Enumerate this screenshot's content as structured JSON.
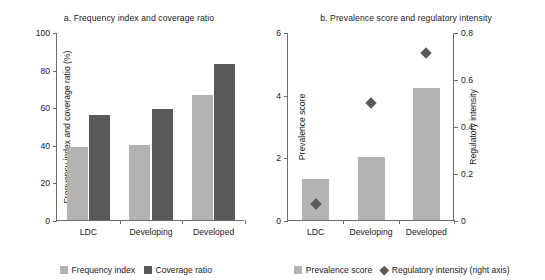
{
  "chart_data": [
    {
      "type": "bar",
      "panel": "a",
      "title": "a. Frequency index and coverage ratio",
      "xlabel": "",
      "ylabel": "Frequency index and coverage ratio (%)",
      "categories": [
        "LDC",
        "Developing",
        "Developed"
      ],
      "series": [
        {
          "name": "Frequency index",
          "values": [
            39,
            40,
            66.5
          ],
          "color": "#b3b3b3"
        },
        {
          "name": "Coverage ratio",
          "values": [
            56,
            59,
            83
          ],
          "color": "#59595b"
        }
      ],
      "ylim": [
        0,
        100
      ],
      "yticks": [
        0,
        20,
        40,
        60,
        80,
        100
      ],
      "ytick_labels": [
        "0",
        "20",
        "40",
        "60",
        "80",
        "100"
      ],
      "grid": false,
      "legend_position": "bottom"
    },
    {
      "type": "bar",
      "panel": "b",
      "title": "b. Prevalence score and regulatory intensity",
      "xlabel": "",
      "ylabel": "Prevalence score",
      "ylabel_right": "Regulatory intensity",
      "categories": [
        "LDC",
        "Developing",
        "Developed"
      ],
      "series": [
        {
          "name": "Prevalence score",
          "type": "bar",
          "axis": "left",
          "values": [
            1.3,
            2.0,
            4.2
          ],
          "color": "#b3b3b3"
        },
        {
          "name": "Regulatory intensity (right axis)",
          "type": "scatter",
          "axis": "right",
          "values": [
            0.07,
            0.5,
            0.71
          ],
          "color": "#59595b",
          "marker": "diamond"
        }
      ],
      "ylim": [
        0,
        6
      ],
      "yticks": [
        0,
        2,
        4,
        6
      ],
      "ytick_labels": [
        "0",
        "2",
        "4",
        "6"
      ],
      "ylim_right": [
        0,
        0.8
      ],
      "yticks_right": [
        0,
        0.2,
        0.4,
        0.6,
        0.8
      ],
      "ytick_labels_right": [
        "0",
        "0.2",
        "0.4",
        "0.6",
        "0.8"
      ],
      "grid": false,
      "legend_position": "bottom"
    }
  ],
  "panel_a": {
    "title": "a. Frequency index and coverage ratio",
    "y_axis_title": "Frequency index and coverage ratio (%)",
    "y_ticks": [
      "0",
      "20",
      "40",
      "60",
      "80",
      "100"
    ],
    "x_ticks": [
      "LDC",
      "Developing",
      "Developed"
    ],
    "legend": [
      {
        "label": "Frequency index",
        "color": "#b3b3b3",
        "shape": "square"
      },
      {
        "label": "Coverage ratio",
        "color": "#59595b",
        "shape": "square"
      }
    ]
  },
  "panel_b": {
    "title": "b. Prevalence score and regulatory intensity",
    "y_axis_title": "Prevalence score",
    "y_axis_title_right": "Regulatory intensity",
    "y_ticks": [
      "0",
      "2",
      "4",
      "6"
    ],
    "y_ticks_right": [
      "0",
      "0.2",
      "0.4",
      "0.6",
      "0.8"
    ],
    "x_ticks": [
      "LDC",
      "Developing",
      "Developed"
    ],
    "legend": [
      {
        "label": "Prevalence score",
        "color": "#b3b3b3",
        "shape": "square"
      },
      {
        "label": "Regulatory intensity (right axis)",
        "color": "#59595b",
        "shape": "diamond"
      }
    ]
  },
  "colors": {
    "light_gray": "#b3b3b3",
    "dark_gray": "#59595b",
    "axis": "#6d6d6d",
    "text": "#1a1a1a",
    "background": "#ffffff"
  }
}
